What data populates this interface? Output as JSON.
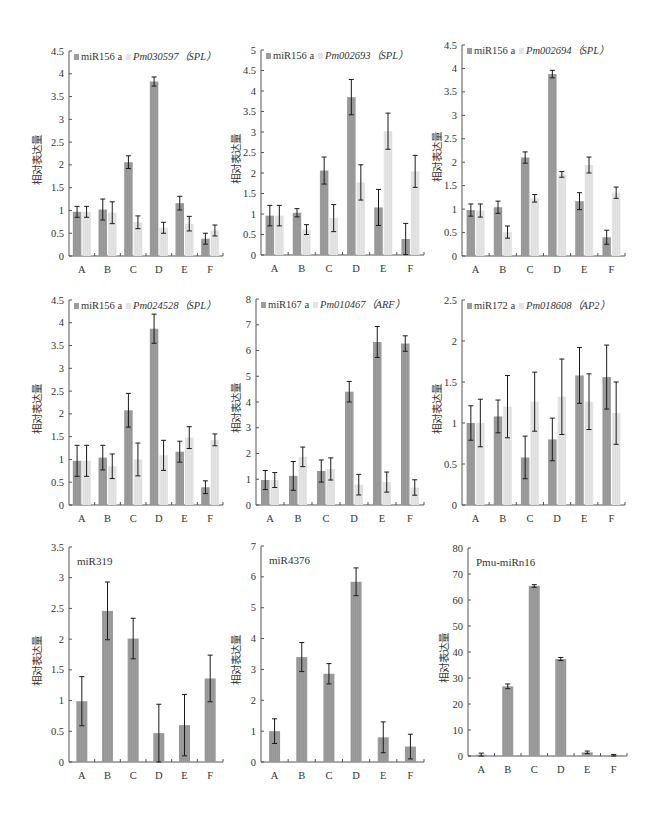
{
  "figure": {
    "caption": "",
    "ylabel_common": "相对表达量",
    "categories": [
      "A",
      "B",
      "C",
      "D",
      "E",
      "F"
    ]
  },
  "colors": {
    "mirna_bar": "#9c9c9c",
    "target_bar": "#e4e4e4",
    "axis": "#555555",
    "error_bar": "#1a1a1a"
  },
  "chart_data": [
    {
      "type": "bar",
      "title": "",
      "legend": [
        "miR156 a",
        "Pm030597（SPL）"
      ],
      "legend_italic": [
        false,
        true
      ],
      "xlabel": "",
      "ylabel": "相对表达量",
      "ylim": [
        0,
        4.5
      ],
      "yticks": [
        0,
        0.5,
        1,
        1.5,
        2,
        2.5,
        3,
        3.5,
        4,
        4.5
      ],
      "categories": [
        "A",
        "B",
        "C",
        "D",
        "E",
        "F"
      ],
      "series": [
        {
          "name": "miR156 a",
          "values": [
            0.97,
            1.02,
            2.06,
            3.83,
            1.16,
            0.38
          ],
          "errors": [
            0.12,
            0.23,
            0.14,
            0.1,
            0.15,
            0.12
          ]
        },
        {
          "name": "Pm030597（SPL）",
          "values": [
            0.97,
            0.95,
            0.74,
            0.62,
            0.71,
            0.56
          ],
          "errors": [
            0.12,
            0.24,
            0.14,
            0.12,
            0.16,
            0.12
          ]
        }
      ],
      "legend_position": "top-inside",
      "grid": false
    },
    {
      "type": "bar",
      "title": "",
      "legend": [
        "miR156 a",
        "Pm002693（SPL）"
      ],
      "legend_italic": [
        false,
        true
      ],
      "xlabel": "",
      "ylabel": "相对表达量",
      "ylim": [
        0,
        5
      ],
      "yticks": [
        0,
        0.5,
        1,
        1.5,
        2,
        2.5,
        3,
        3.5,
        4,
        4.5,
        5
      ],
      "categories": [
        "A",
        "B",
        "C",
        "D",
        "E",
        "F"
      ],
      "series": [
        {
          "name": "miR156 a",
          "values": [
            0.96,
            1.03,
            2.06,
            3.85,
            1.16,
            0.39
          ],
          "errors": [
            0.25,
            0.1,
            0.33,
            0.43,
            0.44,
            0.38
          ]
        },
        {
          "name": "Pm002693（SPL）",
          "values": [
            0.96,
            0.62,
            0.9,
            1.77,
            3.02,
            2.04
          ],
          "errors": [
            0.25,
            0.12,
            0.33,
            0.43,
            0.44,
            0.39
          ]
        }
      ],
      "legend_position": "top-inside",
      "grid": false
    },
    {
      "type": "bar",
      "title": "",
      "legend": [
        "miR156 a",
        "Pm002694（SPL）"
      ],
      "legend_italic": [
        false,
        true
      ],
      "xlabel": "",
      "ylabel": "相对表达量",
      "ylim": [
        0,
        4.5
      ],
      "yticks": [
        0,
        0.5,
        1,
        1.5,
        2,
        2.5,
        3,
        3.5,
        4,
        4.5
      ],
      "categories": [
        "A",
        "B",
        "C",
        "D",
        "E",
        "F"
      ],
      "series": [
        {
          "name": "miR156 a",
          "values": [
            0.98,
            1.04,
            2.1,
            3.88,
            1.17,
            0.4
          ],
          "errors": [
            0.13,
            0.13,
            0.12,
            0.08,
            0.18,
            0.15
          ]
        },
        {
          "name": "Pm002694（SPL）",
          "values": [
            0.97,
            0.51,
            1.23,
            1.74,
            1.94,
            1.35
          ],
          "errors": [
            0.14,
            0.13,
            0.08,
            0.06,
            0.17,
            0.12
          ]
        }
      ],
      "legend_position": "top-inside",
      "grid": false
    },
    {
      "type": "bar",
      "title": "",
      "legend": [
        "miR156 a",
        "Pm024528（SPL）"
      ],
      "legend_italic": [
        false,
        true
      ],
      "xlabel": "",
      "ylabel": "相对表达量",
      "ylim": [
        0,
        4.5
      ],
      "yticks": [
        0,
        0.5,
        1,
        1.5,
        2,
        2.5,
        3,
        3.5,
        4,
        4.5
      ],
      "categories": [
        "A",
        "B",
        "C",
        "D",
        "E",
        "F"
      ],
      "series": [
        {
          "name": "miR156 a",
          "values": [
            0.97,
            1.04,
            2.08,
            3.87,
            1.17,
            0.39
          ],
          "errors": [
            0.34,
            0.27,
            0.37,
            0.32,
            0.23,
            0.14
          ]
        },
        {
          "name": "Pm024528（SPL）",
          "values": [
            0.97,
            0.85,
            1.0,
            1.09,
            1.48,
            1.43
          ],
          "errors": [
            0.34,
            0.27,
            0.36,
            0.33,
            0.24,
            0.13
          ]
        }
      ],
      "legend_position": "top-inside",
      "grid": false
    },
    {
      "type": "bar",
      "title": "",
      "legend": [
        "miR167 a",
        "Pm010467（ARF）"
      ],
      "legend_italic": [
        false,
        true
      ],
      "xlabel": "",
      "ylabel": "相对表达量",
      "ylim": [
        0,
        8
      ],
      "yticks": [
        0,
        1,
        2,
        3,
        4,
        5,
        6,
        7,
        8
      ],
      "categories": [
        "A",
        "B",
        "C",
        "D",
        "E",
        "F"
      ],
      "series": [
        {
          "name": "miR167 a",
          "values": [
            0.97,
            1.13,
            1.32,
            4.4,
            6.33,
            6.27
          ],
          "errors": [
            0.37,
            0.56,
            0.43,
            0.4,
            0.6,
            0.3
          ]
        },
        {
          "name": "Pm010467（ARF）",
          "values": [
            0.97,
            1.87,
            1.4,
            0.79,
            0.89,
            0.68
          ],
          "errors": [
            0.29,
            0.38,
            0.43,
            0.4,
            0.39,
            0.3
          ]
        }
      ],
      "legend_position": "top-inside",
      "grid": false
    },
    {
      "type": "bar",
      "title": "",
      "legend": [
        "miR172 a",
        "Pm018608（AP2）"
      ],
      "legend_italic": [
        false,
        true
      ],
      "xlabel": "",
      "ylabel": "相对表达量",
      "ylim": [
        0,
        2.5
      ],
      "yticks": [
        0,
        0.5,
        1,
        1.5,
        2,
        2.5
      ],
      "categories": [
        "A",
        "B",
        "C",
        "D",
        "E",
        "F"
      ],
      "series": [
        {
          "name": "miR172 a",
          "values": [
            1.0,
            1.08,
            0.58,
            0.8,
            1.58,
            1.56
          ],
          "errors": [
            0.21,
            0.2,
            0.26,
            0.26,
            0.34,
            0.39
          ]
        },
        {
          "name": "Pm018608（AP2）",
          "values": [
            1.0,
            1.2,
            1.26,
            1.32,
            1.26,
            1.12
          ],
          "errors": [
            0.29,
            0.38,
            0.36,
            0.46,
            0.34,
            0.38
          ]
        }
      ],
      "legend_position": "top-inside",
      "grid": false
    },
    {
      "type": "bar",
      "title": "miR319",
      "legend": [],
      "xlabel": "",
      "ylabel": "相对表达量",
      "ylim": [
        0,
        3.5
      ],
      "yticks": [
        0,
        0.5,
        1,
        1.5,
        2,
        2.5,
        3,
        3.5
      ],
      "categories": [
        "A",
        "B",
        "C",
        "D",
        "E",
        "F"
      ],
      "series": [
        {
          "name": "miR319",
          "values": [
            0.99,
            2.46,
            2.01,
            0.47,
            0.6,
            1.36
          ],
          "errors": [
            0.4,
            0.47,
            0.33,
            0.47,
            0.5,
            0.38
          ]
        }
      ],
      "grid": false
    },
    {
      "type": "bar",
      "title": "miR4376",
      "legend": [],
      "xlabel": "",
      "ylabel": "相对表达量",
      "ylim": [
        0,
        7
      ],
      "yticks": [
        0,
        1,
        2,
        3,
        4,
        5,
        6,
        7
      ],
      "categories": [
        "A",
        "B",
        "C",
        "D",
        "E",
        "F"
      ],
      "series": [
        {
          "name": "miR4376",
          "values": [
            1.0,
            3.4,
            2.86,
            5.84,
            0.8,
            0.5
          ],
          "errors": [
            0.4,
            0.47,
            0.33,
            0.45,
            0.5,
            0.4
          ]
        }
      ],
      "grid": false
    },
    {
      "type": "bar",
      "title": "Pmu-miRn16",
      "legend": [],
      "xlabel": "",
      "ylabel": "相对表达量",
      "ylim": [
        0,
        80
      ],
      "yticks": [
        0,
        10,
        20,
        30,
        40,
        50,
        60,
        70,
        80
      ],
      "categories": [
        "A",
        "B",
        "C",
        "D",
        "E",
        "F"
      ],
      "series": [
        {
          "name": "Pmu-miRn16",
          "values": [
            0.5,
            26.8,
            65.4,
            37.3,
            1.4,
            0.3
          ],
          "errors": [
            0.6,
            0.9,
            0.5,
            0.6,
            0.5,
            0.3
          ]
        }
      ],
      "grid": false
    }
  ]
}
